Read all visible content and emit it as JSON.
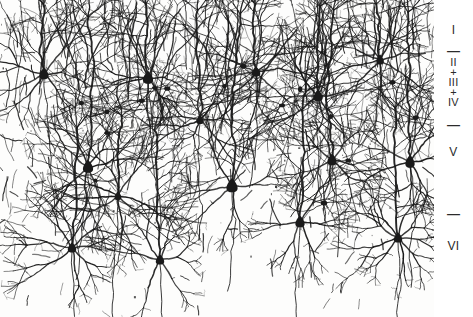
{
  "figure": {
    "background": "#fdfdfc",
    "ink": "#1a1a1a",
    "plate_width": 434,
    "plate_height": 317,
    "total_width": 473,
    "total_height": 317
  },
  "layer_key": {
    "text_color": "#2b2b2b",
    "entries": [
      {
        "id": "layer-i",
        "label": "I",
        "kind": "roman",
        "y": 24
      },
      {
        "id": "rule-i-ii",
        "label": "—",
        "kind": "rule",
        "y": 44
      },
      {
        "id": "layer-ii-iv",
        "label": "II\n+\nIII\n+\nIV",
        "kind": "stack",
        "y": 57
      },
      {
        "id": "rule-iv-v",
        "label": "—",
        "kind": "rule",
        "y": 118
      },
      {
        "id": "layer-v",
        "label": "V",
        "kind": "roman",
        "y": 146
      },
      {
        "id": "rule-v-vi",
        "label": "—",
        "kind": "rule",
        "y": 207
      },
      {
        "id": "layer-vi",
        "label": "VI",
        "kind": "roman",
        "y": 240
      }
    ]
  },
  "drawing": {
    "type": "golgi-cortical-section",
    "pia_y": 0,
    "white_matter_y": 300,
    "somata": [
      {
        "x": 44,
        "y": 74,
        "w": 10,
        "h": 9,
        "apical": 70,
        "type": "pyramidal"
      },
      {
        "x": 148,
        "y": 78,
        "w": 11,
        "h": 10,
        "apical": 74,
        "type": "pyramidal"
      },
      {
        "x": 256,
        "y": 72,
        "w": 9,
        "h": 8,
        "apical": 68,
        "type": "pyramidal"
      },
      {
        "x": 318,
        "y": 96,
        "w": 10,
        "h": 9,
        "apical": 90,
        "type": "pyramidal"
      },
      {
        "x": 380,
        "y": 60,
        "w": 8,
        "h": 8,
        "apical": 56,
        "type": "pyramidal"
      },
      {
        "x": 88,
        "y": 167,
        "w": 11,
        "h": 10,
        "apical": 150,
        "type": "pyramidal"
      },
      {
        "x": 232,
        "y": 186,
        "w": 12,
        "h": 11,
        "apical": 172,
        "type": "pyramidal"
      },
      {
        "x": 332,
        "y": 160,
        "w": 10,
        "h": 9,
        "apical": 150,
        "type": "pyramidal"
      },
      {
        "x": 410,
        "y": 162,
        "w": 10,
        "h": 10,
        "apical": 150,
        "type": "pyramidal"
      },
      {
        "x": 72,
        "y": 248,
        "w": 9,
        "h": 8,
        "apical": 120,
        "type": "pyramidal"
      },
      {
        "x": 160,
        "y": 260,
        "w": 9,
        "h": 8,
        "apical": 130,
        "type": "pyramidal"
      },
      {
        "x": 300,
        "y": 222,
        "w": 10,
        "h": 9,
        "apical": 140,
        "type": "pyramidal"
      },
      {
        "x": 398,
        "y": 238,
        "w": 9,
        "h": 8,
        "apical": 130,
        "type": "pyramidal"
      },
      {
        "x": 200,
        "y": 120,
        "w": 8,
        "h": 7,
        "apical": 110,
        "type": "pyramidal"
      },
      {
        "x": 118,
        "y": 196,
        "w": 7,
        "h": 7,
        "apical": 80,
        "type": "pyramidal"
      }
    ],
    "density_bands": [
      {
        "name": "layer-i",
        "y0": 0,
        "y1": 44,
        "density": 0.55
      },
      {
        "name": "layer-ii-iv",
        "y0": 44,
        "y1": 118,
        "density": 1.0
      },
      {
        "name": "layer-v",
        "y0": 118,
        "y1": 207,
        "density": 0.9
      },
      {
        "name": "layer-vi",
        "y0": 207,
        "y1": 285,
        "density": 0.6
      },
      {
        "name": "white-matter",
        "y0": 285,
        "y1": 317,
        "density": 0.12
      }
    ],
    "seed": 20240517,
    "fiber_count": 620,
    "speck_count": 150
  }
}
